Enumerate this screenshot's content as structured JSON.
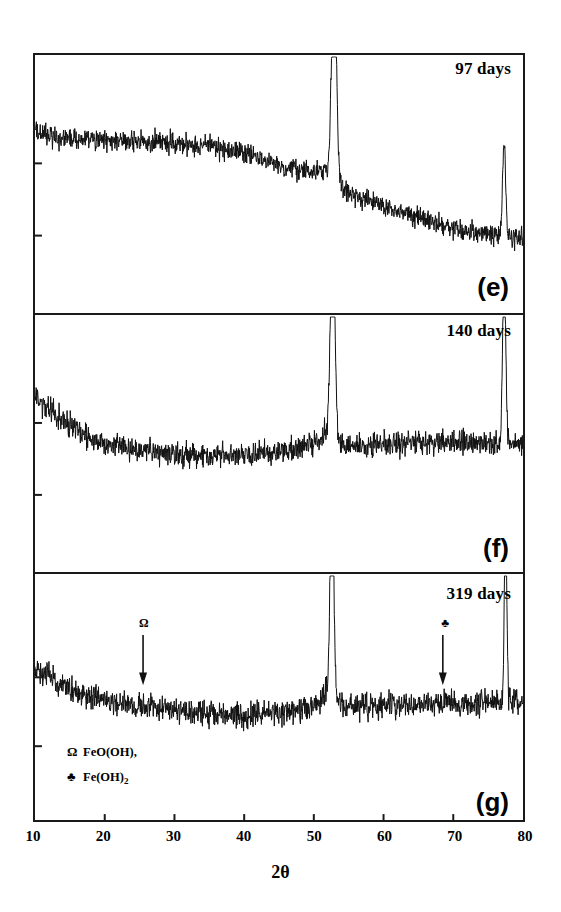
{
  "figure": {
    "axis_title": "2θ",
    "xticks": [
      10,
      20,
      30,
      40,
      50,
      60,
      70,
      80
    ],
    "panels": [
      {
        "letter": "(e)",
        "days": "97 days"
      },
      {
        "letter": "(f)",
        "days": "140 days"
      },
      {
        "letter": "(g)",
        "days": "319 days"
      }
    ],
    "legend": [
      {
        "symbol": "Ω",
        "text": "FeO(OH),",
        "sub": ""
      },
      {
        "symbol": "♣",
        "text": "Fe(OH)",
        "sub": "2"
      }
    ],
    "markers": [
      {
        "symbol": "Ω",
        "two_theta": 25.5
      },
      {
        "symbol": "♣",
        "two_theta": 68.5
      }
    ],
    "line_color": "#111111"
  },
  "chart_data": {
    "type": "line",
    "title": "",
    "xlabel": "2θ",
    "ylabel": "Intensity (a.u.)",
    "xlim": [
      10,
      80
    ],
    "grid": false,
    "legend_position": "inside-bottom-left",
    "series": [
      {
        "name": "97 days",
        "panel": "(e)",
        "baseline_points": [
          {
            "x": 10,
            "y": 0.8
          },
          {
            "x": 13,
            "y": 0.77
          },
          {
            "x": 18,
            "y": 0.76
          },
          {
            "x": 24,
            "y": 0.755
          },
          {
            "x": 30,
            "y": 0.75
          },
          {
            "x": 35,
            "y": 0.735
          },
          {
            "x": 40,
            "y": 0.7
          },
          {
            "x": 44,
            "y": 0.655
          },
          {
            "x": 48,
            "y": 0.62
          },
          {
            "x": 51,
            "y": 0.61
          },
          {
            "x": 52.3,
            "y": 0.62
          },
          {
            "x": 53.5,
            "y": 0.55
          },
          {
            "x": 56,
            "y": 0.5
          },
          {
            "x": 60,
            "y": 0.455
          },
          {
            "x": 65,
            "y": 0.4
          },
          {
            "x": 70,
            "y": 0.355
          },
          {
            "x": 75,
            "y": 0.325
          },
          {
            "x": 80,
            "y": 0.305
          }
        ],
        "peaks": [
          {
            "two_theta": 52.9,
            "height": 1.02,
            "width": 0.45,
            "label": "main"
          },
          {
            "two_theta": 77.3,
            "height": 0.44,
            "width": 0.28,
            "label": "minor"
          }
        ],
        "noise": 0.022
      },
      {
        "name": "140 days",
        "panel": "(f)",
        "baseline_points": [
          {
            "x": 10,
            "y": 0.78
          },
          {
            "x": 12,
            "y": 0.72
          },
          {
            "x": 15,
            "y": 0.64
          },
          {
            "x": 18,
            "y": 0.58
          },
          {
            "x": 22,
            "y": 0.545
          },
          {
            "x": 26,
            "y": 0.525
          },
          {
            "x": 32,
            "y": 0.505
          },
          {
            "x": 38,
            "y": 0.5
          },
          {
            "x": 43,
            "y": 0.515
          },
          {
            "x": 47,
            "y": 0.535
          },
          {
            "x": 50,
            "y": 0.565
          },
          {
            "x": 51.6,
            "y": 0.6
          },
          {
            "x": 53.8,
            "y": 0.545
          },
          {
            "x": 56,
            "y": 0.545
          },
          {
            "x": 60,
            "y": 0.555
          },
          {
            "x": 64,
            "y": 0.565
          },
          {
            "x": 68,
            "y": 0.565
          },
          {
            "x": 72,
            "y": 0.56
          },
          {
            "x": 76,
            "y": 0.555
          },
          {
            "x": 80,
            "y": 0.56
          }
        ],
        "peaks": [
          {
            "two_theta": 52.7,
            "height": 1.05,
            "width": 0.42,
            "label": "main"
          },
          {
            "two_theta": 77.3,
            "height": 0.8,
            "width": 0.3,
            "label": "minor"
          }
        ],
        "noise": 0.026
      },
      {
        "name": "319 days",
        "panel": "(g)",
        "baseline_points": [
          {
            "x": 10,
            "y": 0.7
          },
          {
            "x": 12,
            "y": 0.655
          },
          {
            "x": 15,
            "y": 0.6
          },
          {
            "x": 18,
            "y": 0.565
          },
          {
            "x": 22,
            "y": 0.53
          },
          {
            "x": 26,
            "y": 0.515
          },
          {
            "x": 30,
            "y": 0.495
          },
          {
            "x": 35,
            "y": 0.475
          },
          {
            "x": 40,
            "y": 0.475
          },
          {
            "x": 45,
            "y": 0.485
          },
          {
            "x": 49,
            "y": 0.505
          },
          {
            "x": 51,
            "y": 0.545
          },
          {
            "x": 52,
            "y": 0.6
          },
          {
            "x": 54,
            "y": 0.515
          },
          {
            "x": 58,
            "y": 0.515
          },
          {
            "x": 62,
            "y": 0.52
          },
          {
            "x": 66,
            "y": 0.525
          },
          {
            "x": 70,
            "y": 0.525
          },
          {
            "x": 74,
            "y": 0.53
          },
          {
            "x": 77.5,
            "y": 0.545
          },
          {
            "x": 80,
            "y": 0.535
          }
        ],
        "peaks": [
          {
            "two_theta": 52.6,
            "height": 1.03,
            "width": 0.35,
            "label": "main"
          },
          {
            "two_theta": 77.5,
            "height": 1.0,
            "width": 0.22,
            "label": "minor"
          }
        ],
        "noise": 0.028
      }
    ]
  }
}
